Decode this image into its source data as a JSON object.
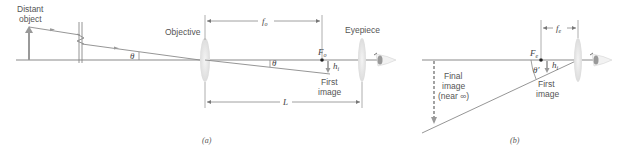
{
  "diagram": {
    "panel_a": {
      "caption": "(a)",
      "labels": {
        "distant_object_line1": "Distant",
        "distant_object_line2": "object",
        "objective": "Objective",
        "eyepiece": "Eyepiece",
        "fo": "f",
        "fo_sub": "o",
        "Fo": "F",
        "Fo_sub": "o",
        "h1": "h",
        "h1_sub": "i",
        "theta_left": "θ",
        "theta_right": "θ",
        "first_image_line1": "First",
        "first_image_line2": "image",
        "L": "L"
      }
    },
    "panel_b": {
      "caption": "(b)",
      "labels": {
        "fe": "f",
        "fe_sub": "e",
        "Fe": "F",
        "Fe_sub": "e",
        "h1": "h",
        "h1_sub": "i",
        "theta_prime": "θ′",
        "first_image_line1": "First",
        "first_image_line2": "image",
        "final_image_line1": "Final",
        "final_image_line2": "image",
        "final_image_line3": "(near ∞)"
      }
    },
    "colors": {
      "line": "#8a8a8a",
      "axis": "#9a9a9a",
      "lens": "#e6e6e6",
      "text": "#555555",
      "point": "#222222"
    }
  }
}
